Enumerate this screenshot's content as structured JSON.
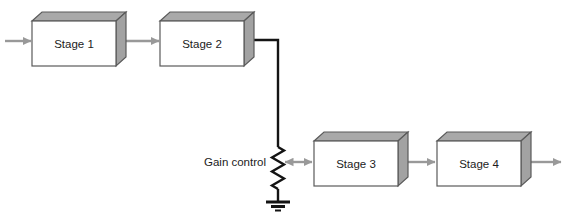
{
  "diagram": {
    "boxes": [
      {
        "label": "Stage 1"
      },
      {
        "label": "Stage 2"
      },
      {
        "label": "Stage 3"
      },
      {
        "label": "Stage 4"
      }
    ],
    "gain_control": {
      "label": "Gain control"
    },
    "colors": {
      "background": "#ffffff",
      "box_face": "#ffffff",
      "box_top": "#a9a9a9",
      "box_side": "#a2a2a2",
      "box_border": "#5a5a5a",
      "arrow": "#999999",
      "signal_line": "#141414",
      "label_text": "#1c1c1c"
    }
  }
}
